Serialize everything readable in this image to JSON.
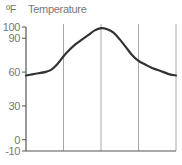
{
  "chart_data": {
    "type": "line",
    "title": "Temperature",
    "unit_label": "ºF",
    "xlabel": "",
    "ylabel": "ºF",
    "ylim": [
      -10,
      100
    ],
    "y_ticks": [
      100,
      90,
      60,
      30,
      0,
      -10
    ],
    "x_gridlines": 4,
    "grid": {
      "vertical": true,
      "horizontal": false
    },
    "legend": null,
    "series": [
      {
        "name": "Temperature",
        "color": "#333333",
        "x": [
          0,
          0.5,
          1,
          1.5,
          2,
          2.5,
          3,
          3.5,
          4,
          4.5,
          5,
          5.5,
          6,
          6.5,
          7,
          7.5,
          8,
          8.5,
          9,
          9.5,
          10,
          10.5,
          11,
          11.5,
          12
        ],
        "values": [
          57,
          58,
          59,
          60,
          62,
          67,
          74,
          80,
          85,
          89,
          93,
          97,
          99,
          98,
          95,
          89,
          82,
          75,
          70,
          67,
          64,
          62,
          60,
          58,
          57
        ]
      }
    ]
  }
}
